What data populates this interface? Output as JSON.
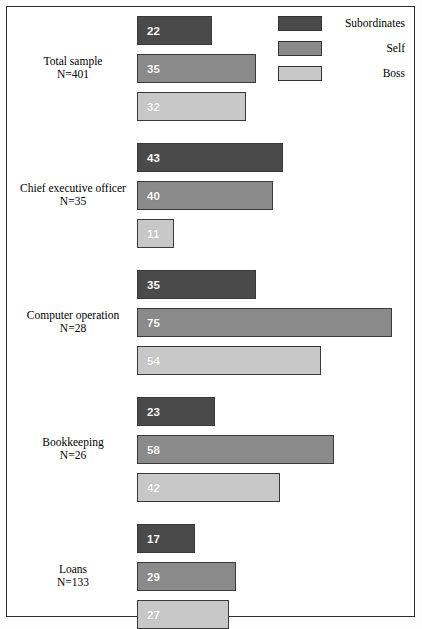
{
  "chart_data": {
    "type": "bar",
    "orientation": "horizontal",
    "title": "",
    "subtitle": "",
    "xlabel": "",
    "ylabel": "",
    "grid": false,
    "xlim": [
      0,
      80
    ],
    "legend_position": "top-right",
    "categories": [
      "Total sample",
      "Chief executive officer",
      "Computer operation",
      "Bookkeeping",
      "Loans"
    ],
    "category_sublabels": [
      "N=401",
      "N=35",
      "N=28",
      "N=26",
      "N=133"
    ],
    "series": [
      {
        "name": "Subordinates",
        "color": "#4a4a4a",
        "values": [
          22,
          43,
          35,
          23,
          17
        ]
      },
      {
        "name": "Self",
        "color": "#8a8a8a",
        "values": [
          35,
          40,
          75,
          58,
          29
        ]
      },
      {
        "name": "Boss",
        "color": "#c8c8c8",
        "values": [
          32,
          11,
          54,
          42,
          27
        ]
      }
    ]
  },
  "legend": {
    "items": [
      {
        "label": "Subordinates",
        "color": "#4a4a4a",
        "swatch_name": "legend-swatch-subordinates"
      },
      {
        "label": "Self",
        "color": "#8a8a8a",
        "swatch_name": "legend-swatch-self"
      },
      {
        "label": "Boss",
        "color": "#c8c8c8",
        "swatch_name": "legend-swatch-boss"
      }
    ]
  },
  "layout": {
    "bar_origin_x": 137,
    "px_per_unit": 3.4,
    "bar_height": 29,
    "bar_gap": 9,
    "group_gap": 22,
    "first_group_top": 16,
    "border_color": "#2e2e2e",
    "bar_border_color": "#3a3a3a",
    "value_text_color": "#ffffff",
    "background": "#ffffff"
  }
}
